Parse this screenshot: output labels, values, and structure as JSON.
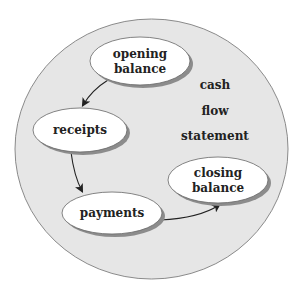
{
  "diagram": {
    "title_lines": [
      "cash",
      "flow",
      "statement"
    ],
    "nodes": [
      {
        "id": "opening",
        "lines": [
          "opening",
          "balance"
        ]
      },
      {
        "id": "receipts",
        "lines": [
          "receipts"
        ]
      },
      {
        "id": "payments",
        "lines": [
          "payments"
        ]
      },
      {
        "id": "closing",
        "lines": [
          "closing",
          "balance"
        ]
      }
    ],
    "edges": [
      {
        "from": "opening",
        "to": "receipts"
      },
      {
        "from": "receipts",
        "to": "payments"
      },
      {
        "from": "payments",
        "to": "closing"
      }
    ],
    "colors": {
      "background_circle": "#e6e6e6",
      "circle_stroke": "#8a8a8a",
      "node_fill": "#ffffff",
      "node_shadow": "#8c8c8c",
      "text": "#222222",
      "arrow": "#222222"
    }
  }
}
